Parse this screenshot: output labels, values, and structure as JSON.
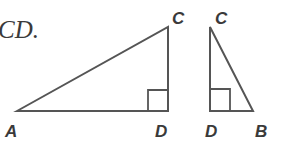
{
  "caption": "CD.",
  "diagram": {
    "stroke_color": "#555555",
    "triangles": [
      {
        "name": "triangle-ACD",
        "vertices": {
          "A": {
            "label": "A",
            "x": 17,
            "y": 111
          },
          "C": {
            "label": "C",
            "x": 168,
            "y": 27
          },
          "D": {
            "label": "D",
            "x": 168,
            "y": 111
          }
        },
        "right_angle_at": "D"
      },
      {
        "name": "triangle-CDB",
        "vertices": {
          "C": {
            "label": "C",
            "x": 210,
            "y": 27
          },
          "D": {
            "label": "D",
            "x": 210,
            "y": 111
          },
          "B": {
            "label": "B",
            "x": 253,
            "y": 111
          }
        },
        "right_angle_at": "D"
      }
    ]
  }
}
